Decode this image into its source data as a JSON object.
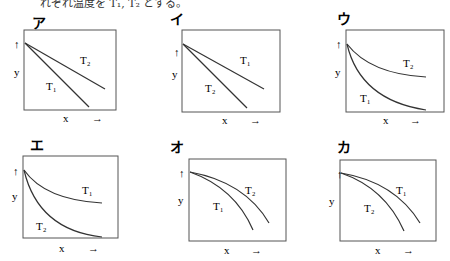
{
  "header": {
    "text": "れぞれ温度を T₁, T₂ とする。"
  },
  "panels": [
    {
      "label": "ア",
      "curve_type": "linear",
      "upper_curve": "T₂",
      "lower_curve": "T₁",
      "y_label": "y",
      "y_arrow": "↑",
      "x_label": "x",
      "x_arrow": "→"
    },
    {
      "label": "イ",
      "curve_type": "linear",
      "upper_curve": "T₁",
      "lower_curve": "T₂",
      "y_label": "y",
      "y_arrow": "↑",
      "x_label": "x",
      "x_arrow": "→"
    },
    {
      "label": "ウ",
      "curve_type": "convex-decay",
      "upper_curve": "T₂",
      "lower_curve": "T₁",
      "y_label": "y",
      "y_arrow": "↑",
      "x_label": "x",
      "x_arrow": "→"
    },
    {
      "label": "エ",
      "curve_type": "convex-decay",
      "upper_curve": "T₁",
      "lower_curve": "T₂",
      "y_label": "y",
      "y_arrow": "↑",
      "x_label": "x",
      "x_arrow": "→"
    },
    {
      "label": "オ",
      "curve_type": "concave-drop",
      "upper_curve": "T₂",
      "lower_curve": "T₁",
      "y_label": "y",
      "y_arrow": "↑",
      "x_label": "x",
      "x_arrow": "→"
    },
    {
      "label": "カ",
      "curve_type": "concave-drop",
      "upper_curve": "T₁",
      "lower_curve": "T₂",
      "y_label": "y",
      "y_arrow": "↑",
      "x_label": "x",
      "x_arrow": "→"
    }
  ]
}
